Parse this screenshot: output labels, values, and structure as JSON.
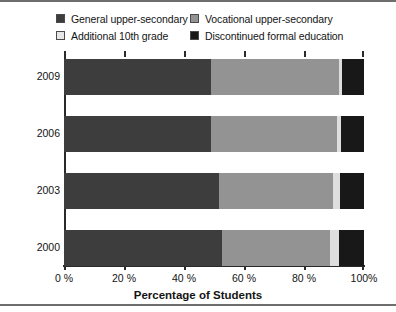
{
  "chart_data": {
    "type": "bar",
    "orientation": "horizontal",
    "stacked": true,
    "stack_total": 100,
    "title": "",
    "xlabel": "Percentage of Students",
    "ylabel": "",
    "xlim": [
      0,
      100
    ],
    "xticks": [
      0,
      20,
      40,
      60,
      80,
      100
    ],
    "xtick_labels": [
      "0 %",
      "20 %",
      "40 %",
      "60 %",
      "80 %",
      "100%"
    ],
    "categories": [
      "2009",
      "2006",
      "2003",
      "2000"
    ],
    "grid": false,
    "legend_position": "top",
    "series": [
      {
        "name": "General upper-secondary",
        "color": "#3d3d3d",
        "values": [
          49.0,
          49.0,
          51.5,
          52.5
        ]
      },
      {
        "name": "Vocational upper-secondary",
        "color": "#939393",
        "values": [
          42.5,
          42.0,
          38.0,
          36.0
        ]
      },
      {
        "name": "Additional 10th grade",
        "color": "#dedede",
        "values": [
          1.3,
          1.3,
          2.5,
          3.0
        ]
      },
      {
        "name": "Discontinued formal education",
        "color": "#181818",
        "values": [
          7.2,
          7.7,
          8.0,
          8.5
        ]
      }
    ]
  },
  "legend": {
    "items": [
      {
        "label": "General upper-secondary",
        "color": "#3d3d3d",
        "icon": "legend-swatch-icon"
      },
      {
        "label": "Vocational upper-secondary",
        "color": "#939393",
        "icon": "legend-swatch-icon"
      },
      {
        "label": "Additional 10th grade",
        "color": "#e6e6e6",
        "icon": "legend-swatch-icon"
      },
      {
        "label": "Discontinued formal education",
        "color": "#181818",
        "icon": "legend-swatch-icon"
      }
    ]
  },
  "axis": {
    "x_title": "Percentage of Students",
    "x_tick_labels": [
      "0 %",
      "20 %",
      "40 %",
      "60 %",
      "80 %",
      "100%"
    ],
    "y_tick_labels": [
      "2009",
      "2006",
      "2003",
      "2000"
    ]
  }
}
